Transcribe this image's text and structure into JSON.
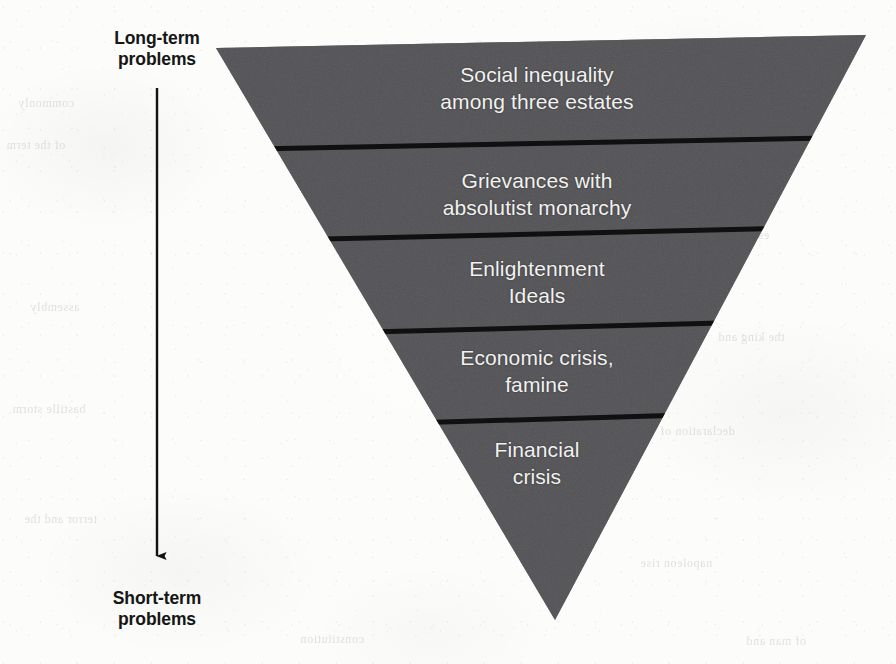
{
  "figure": {
    "shape": "inverted-triangle",
    "fill_color": "#565658",
    "divider_color": "#111111",
    "text_color": "#f2f2f0",
    "background_color": "#fcfcfa",
    "axis": {
      "top_label": {
        "line1": "Long-term",
        "line2": "problems"
      },
      "bottom_label": {
        "line1": "Short-term",
        "line2": "problems"
      },
      "arrow_direction": "down",
      "arrow_color": "#121212"
    },
    "bands": [
      {
        "index": 1,
        "line1": "Social inequality",
        "line2": "among three estates"
      },
      {
        "index": 2,
        "line1": "Grievances with",
        "line2": "absolutist monarchy"
      },
      {
        "index": 3,
        "line1": "Enlightenment",
        "line2": "Ideals"
      },
      {
        "index": 4,
        "line1": "Economic crisis,",
        "line2": "famine"
      },
      {
        "index": 5,
        "line1": "Financial",
        "line2": "crisis"
      }
    ]
  },
  "showthrough": [
    {
      "text": "commonly",
      "x": 18,
      "y": 96
    },
    {
      "text": "of the term",
      "x": 6,
      "y": 138
    },
    {
      "text": "revolution",
      "x": 700,
      "y": 96
    },
    {
      "text": "estates general",
      "x": 690,
      "y": 228
    },
    {
      "text": "assembly",
      "x": 30,
      "y": 300
    },
    {
      "text": "the king and",
      "x": 718,
      "y": 330
    },
    {
      "text": "bastille storm",
      "x": 12,
      "y": 402
    },
    {
      "text": "declaration of",
      "x": 660,
      "y": 424
    },
    {
      "text": "terror and the",
      "x": 24,
      "y": 512
    },
    {
      "text": "napoleon rise",
      "x": 640,
      "y": 556
    },
    {
      "text": "constitution",
      "x": 300,
      "y": 632
    },
    {
      "text": "of man and",
      "x": 746,
      "y": 634
    }
  ]
}
